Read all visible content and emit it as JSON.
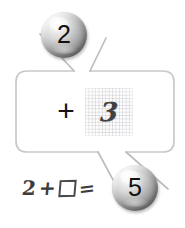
{
  "page": {
    "background_color": "#ffffff",
    "width": 185,
    "height": 228
  },
  "callout": {
    "name": "rounded-callout-box",
    "border_color": "#c9c9c9",
    "fill_color": "#ffffff",
    "operator": "+",
    "grid_cell": {
      "value": "3",
      "style": "handwritten",
      "background": "graph-paper",
      "grid_line_color": "#7878874d"
    }
  },
  "spheres": [
    {
      "id": "sphere-top",
      "label": "2",
      "name": "number-sphere-2",
      "points_to": "top-notch"
    },
    {
      "id": "sphere-bottom",
      "label": "5",
      "name": "number-sphere-5",
      "points_to": "bottom-notch"
    }
  ],
  "equation": {
    "name": "handwritten-equation",
    "full_text": "2 + □ =",
    "first_operand": "2",
    "operator": "+",
    "placeholder": "□",
    "equals": "=",
    "answer_shown_in": "number-sphere-5"
  },
  "colors": {
    "sphere_light": "#ffffff",
    "sphere_mid": "#a9a9a9",
    "sphere_dark": "#585858",
    "ink": "#3c3c3c",
    "frame_stroke": "#c9c9c9"
  }
}
